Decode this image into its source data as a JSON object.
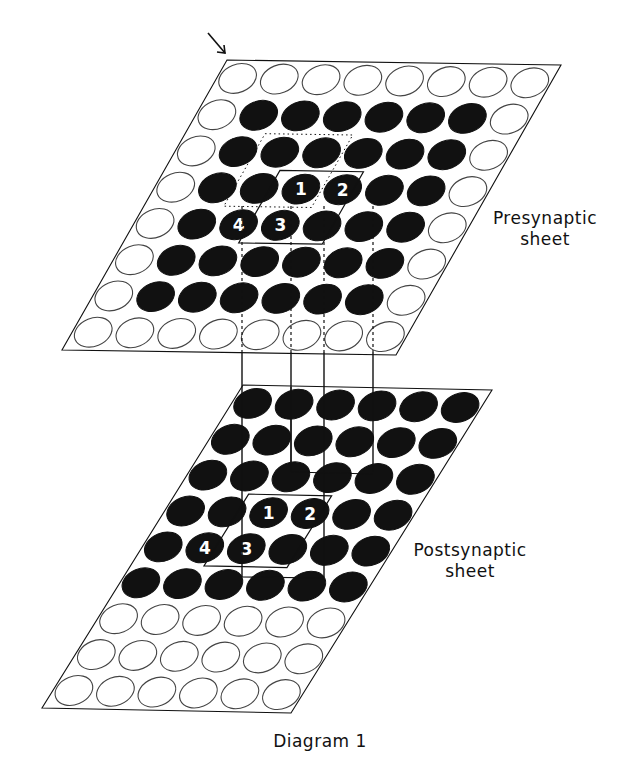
{
  "figure": {
    "caption": "Diagram 1",
    "colors": {
      "ink": "#111111",
      "paper": "#ffffff",
      "empty_stroke": "#444444"
    }
  },
  "presynaptic": {
    "label_line1": "Presynaptic",
    "label_line2": "sheet",
    "cols": 8,
    "rows": 8,
    "corners": {
      "tl": [
        227,
        60
      ],
      "tr": [
        561,
        65
      ],
      "bl": [
        62,
        350
      ]
    },
    "grid": [
      "00000000",
      "01111110",
      "01111110",
      "01111110",
      "01111110",
      "01111110",
      "01111110",
      "00000000"
    ],
    "numbered": [
      {
        "label": "1",
        "row": 3,
        "col": 3
      },
      {
        "label": "2",
        "row": 3,
        "col": 4
      },
      {
        "label": "4",
        "row": 4,
        "col": 2
      },
      {
        "label": "3",
        "row": 4,
        "col": 3
      }
    ],
    "solid_box": {
      "r0": 3,
      "c0": 2.75,
      "r1": 5,
      "c1": 4.75
    },
    "dotted_box": {
      "r0": 2,
      "c0": 1.9,
      "r1": 4,
      "c1": 4
    }
  },
  "postsynaptic": {
    "label_line1": "Postsynaptic",
    "label_line2": "sheet",
    "cols": 6,
    "rows": 9,
    "corners": {
      "tl": [
        243,
        385
      ],
      "tr": [
        492,
        390
      ],
      "bl": [
        42,
        708
      ]
    },
    "grid": [
      "111111",
      "111111",
      "111111",
      "111111",
      "111111",
      "111111",
      "000000",
      "000000",
      "000000"
    ],
    "numbered": [
      {
        "label": "1",
        "row": 3,
        "col": 2
      },
      {
        "label": "2",
        "row": 3,
        "col": 3
      },
      {
        "label": "4",
        "row": 4,
        "col": 1
      },
      {
        "label": "3",
        "row": 4,
        "col": 2
      }
    ],
    "solid_box": {
      "r0": 3,
      "c0": 1.75,
      "r1": 5,
      "c1": 3.75
    }
  },
  "connections": {
    "xs": [
      242,
      291,
      324,
      373
    ],
    "pre_dotted_from_y": [
      206,
      206,
      206,
      206
    ],
    "pre_bottom_y": 352,
    "post_top_y": 387,
    "post_end_y": [
      577,
      472,
      577,
      472
    ]
  },
  "arrow": {
    "from": [
      208,
      33
    ],
    "to": [
      225,
      53
    ]
  }
}
